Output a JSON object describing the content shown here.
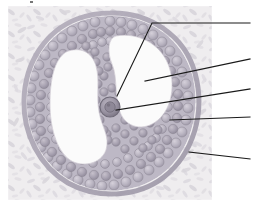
{
  "figure": {
    "kind": "histology-micrograph-illustration",
    "caption": "",
    "specimen": "ovarian antral (secondary) follicle",
    "stain_palette": {
      "background_page": "#ffffff",
      "slide_field": "#f2f0f1",
      "stroma_pale": "#eceaec",
      "stroma_cell": "#d9d6da",
      "granulosa_fill": "#b9b4bd",
      "granulosa_edge": "#8d8795",
      "granulosa_highlight": "#cfcad4",
      "theca_band": "#a49ead",
      "antrum_white": "#fbfbfb",
      "oocyte_fill": "#9a94a3",
      "oocyte_edge": "#6f6a78",
      "leader_line": "#1a1a1a"
    },
    "slide_frame": {
      "x": 8,
      "y": 6,
      "width": 204,
      "height": 194
    }
  },
  "structures": [
    {
      "id": "antrum",
      "name": "antrum",
      "description": "large clear follicular cavity"
    },
    {
      "id": "oocyte",
      "name": "oocyte",
      "description": "darker round germ cell within cumulus"
    },
    {
      "id": "granulosa",
      "name": "granulosa cell layer",
      "description": "ring of rounded granulosa cells"
    },
    {
      "id": "theca",
      "name": "theca layer",
      "description": "outer follicular wall"
    },
    {
      "id": "stroma",
      "name": "ovarian stroma",
      "description": "spindle-shaped connective tissue cells outside follicle"
    }
  ],
  "leader_lines": [
    {
      "id": "leader-1",
      "target_structure": "oocyte",
      "label": "",
      "points": "117,96 152,23 250,23",
      "tip": {
        "x": 117,
        "y": 96
      },
      "end": {
        "x": 250,
        "y": 23
      }
    },
    {
      "id": "leader-2",
      "target_structure": "antrum",
      "label": "",
      "points": "145,81 250,59",
      "tip": {
        "x": 145,
        "y": 81
      },
      "end": {
        "x": 250,
        "y": 59
      }
    },
    {
      "id": "leader-3",
      "target_structure": "oocyte",
      "label": "",
      "points": "116,110 250,89",
      "tip": {
        "x": 116,
        "y": 110
      },
      "end": {
        "x": 250,
        "y": 89
      }
    },
    {
      "id": "leader-4",
      "target_structure": "granulosa",
      "label": "",
      "points": "170,120 250,117",
      "tip": {
        "x": 170,
        "y": 120
      },
      "end": {
        "x": 250,
        "y": 117
      }
    },
    {
      "id": "leader-5",
      "target_structure": "stroma",
      "label": "",
      "points": "189,152 250,159",
      "tip": {
        "x": 189,
        "y": 152
      },
      "end": {
        "x": 250,
        "y": 159
      }
    }
  ],
  "artifacts": [
    {
      "id": "speck-top",
      "x": 30,
      "y": 1,
      "width": 3,
      "height": 2
    }
  ]
}
